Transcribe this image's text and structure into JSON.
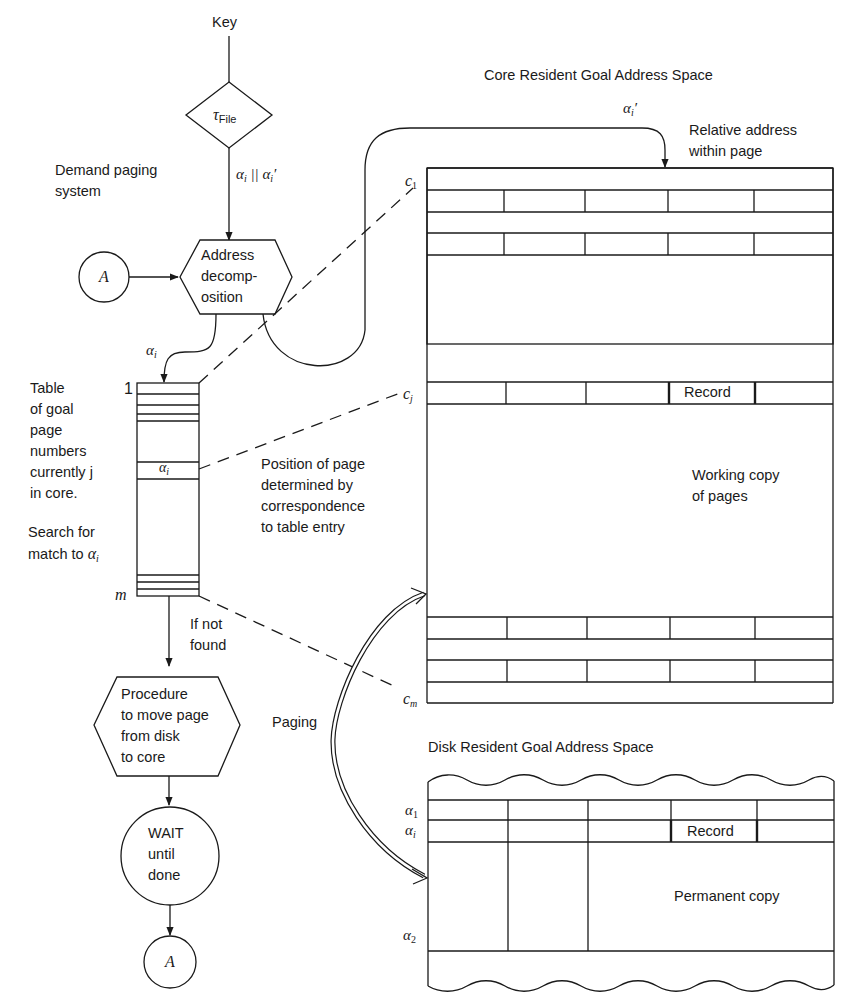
{
  "diagram": {
    "title_top": "Key",
    "decision": {
      "symbol": "τ",
      "subscript": "File"
    },
    "edge_key_to_decomp": {
      "label": "α_i || α_i'"
    },
    "caption_left": "Demand paging\nsystem",
    "connector_a_top": "A",
    "address_decomposition": "Address\ndecomp-\nosition",
    "edge_to_table": "α_i",
    "table": {
      "caption": "Table\nof goal\npage\nnumbers\ncurrently j\nin core.",
      "search_caption": "Search for\nmatch to α_i",
      "top_index": "1",
      "bottom_index": "m",
      "entry_label": "α_i"
    },
    "position_note": "Position of page\ndetermined by\ncorrespondence\nto table entry",
    "if_not_found": "If not\nfound",
    "procedure": "Procedure\nto move page\nfrom disk\nto core",
    "wait": "WAIT\nuntil\ndone",
    "connector_a_bottom": "A",
    "paging_label": "Paging",
    "core_space": {
      "title": "Core Resident Goal Address Space",
      "offset_label": "α_i'",
      "relative_address": "Relative address\nwithin page",
      "row_labels": [
        "c_1",
        "c_j",
        "c_m"
      ],
      "record_label": "Record",
      "working_copy": "Working copy\nof pages"
    },
    "disk_space": {
      "title": "Disk Resident Goal Address Space",
      "row_labels": [
        "α_1",
        "α_i",
        "α_2"
      ],
      "record_label": "Record",
      "permanent_copy": "Permanent copy"
    }
  }
}
